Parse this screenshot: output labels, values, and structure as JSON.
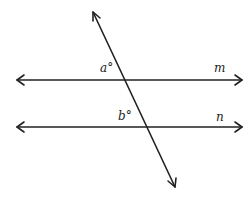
{
  "diagram": {
    "stroke_color": "#222222",
    "lines": [
      {
        "name": "m",
        "label": "m",
        "x1": 17,
        "y1": 80,
        "x2": 242,
        "y2": 80
      },
      {
        "name": "n",
        "label": "n",
        "x1": 17,
        "y1": 127,
        "x2": 242,
        "y2": 127
      },
      {
        "name": "transversal",
        "label": "",
        "x1": 93,
        "y1": 12,
        "x2": 175,
        "y2": 187
      }
    ],
    "angles": [
      {
        "name": "a",
        "label": "a°"
      },
      {
        "name": "b",
        "label": "b°"
      }
    ]
  }
}
